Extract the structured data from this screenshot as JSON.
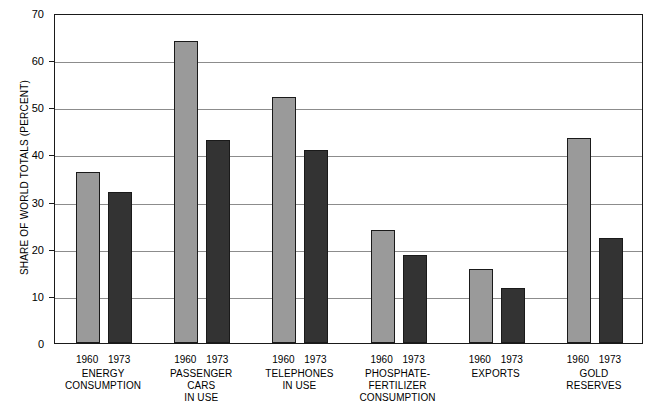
{
  "chart_data": {
    "type": "bar",
    "title": "",
    "subtitle": "",
    "xlabel": "",
    "ylabel": "SHARE OF WORLD TOTALS (PERCENT)",
    "ylim": [
      0,
      70
    ],
    "ytick_values": [
      0,
      10,
      20,
      30,
      40,
      50,
      60,
      70
    ],
    "ytick_labels": [
      "0",
      "10",
      "20",
      "30",
      "40",
      "50",
      "60",
      "70"
    ],
    "grid": "horizontal",
    "legend_position": "none",
    "categories": [
      "ENERGY\nCONSUMPTION",
      "PASSENGER\nCARS\nIN USE",
      "TELEPHONES\nIN USE",
      "PHOSPHATE-\nFERTILIZER\nCONSUMPTION",
      "EXPORTS",
      "GOLD\nRESERVES"
    ],
    "series": [
      {
        "name": "1960",
        "color": "#9a9a9a",
        "values": [
          36.2,
          64.0,
          52.2,
          24.0,
          15.6,
          43.5
        ]
      },
      {
        "name": "1973",
        "color": "#333333",
        "values": [
          32.0,
          43.0,
          41.0,
          18.7,
          11.6,
          22.3
        ]
      }
    ],
    "annotations": []
  },
  "axis": {
    "y_title": "SHARE OF WORLD TOTALS (PERCENT)"
  },
  "colors": {
    "series_1960": "#9a9a9a",
    "series_1973": "#333333",
    "axis": "#1a1a1a",
    "gridline": "#8c8c8c",
    "background": "#ffffff"
  }
}
